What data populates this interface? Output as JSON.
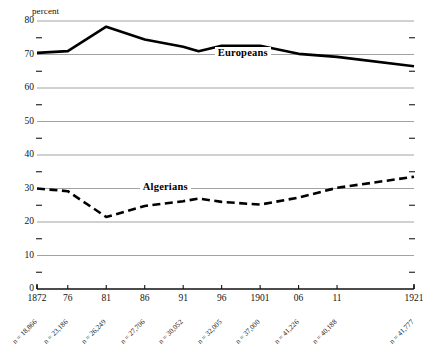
{
  "chart_data": {
    "type": "line",
    "title": "",
    "subtitle": "",
    "xlabel": "",
    "ylabel": "percent",
    "grid": true,
    "legend_position": "inline-annotation",
    "xlim": [
      1872,
      1921
    ],
    "ylim": [
      0,
      80
    ],
    "y_major_ticks": [
      0,
      10,
      20,
      30,
      40,
      50,
      60,
      70,
      80
    ],
    "y_minor_ticks": [
      5,
      15,
      25,
      35,
      45,
      55,
      65,
      75
    ],
    "x_tick_values": [
      1872,
      1876,
      1881,
      1886,
      1891,
      1896,
      1901,
      1906,
      1911,
      1921
    ],
    "x_tick_labels": [
      "1872",
      "76",
      "81",
      "86",
      "91",
      "96",
      "1901",
      "06",
      "11",
      "1921"
    ],
    "x_sample_sizes": [
      "n = 18,866",
      "n = 23,186",
      "n = 26,249",
      "n = 27,706",
      "n = 30,052",
      "n = 32,005",
      "n = 37,000",
      "n = 41,226",
      "n = 40,188",
      "n = 41,777"
    ],
    "x": [
      1872,
      1876,
      1881,
      1886,
      1891,
      1893,
      1896,
      1901,
      1906,
      1911,
      1921
    ],
    "series": [
      {
        "name": "Europeans",
        "style": "solid",
        "color": "#000000",
        "values": [
          70.5,
          71.0,
          78.3,
          74.5,
          72.3,
          71.0,
          72.6,
          72.6,
          70.2,
          69.3,
          66.5
        ]
      },
      {
        "name": "Algerians",
        "style": "dashed",
        "color": "#000000",
        "values": [
          30.0,
          29.2,
          21.5,
          24.8,
          26.2,
          27.0,
          26.0,
          25.2,
          27.3,
          30.2,
          33.5
        ]
      }
    ]
  },
  "annotations": {
    "europeans_label": "Europeans",
    "algerians_label": "Algerians",
    "percent_label": "percent"
  }
}
